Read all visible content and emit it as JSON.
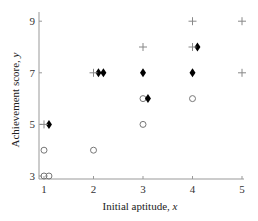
{
  "chart_data": {
    "type": "scatter",
    "title": "",
    "xlabel": "Initial aptitude, x",
    "xlabel_main": "Initial aptitude, ",
    "xlabel_var": "x",
    "ylabel": "Achievement score, y",
    "ylabel_main": "Achievement score, ",
    "ylabel_var": "y",
    "xlim": [
      1,
      5
    ],
    "ylim": [
      3,
      9
    ],
    "xticks": [
      1,
      2,
      3,
      4,
      5
    ],
    "yticks": [
      3,
      5,
      7,
      9
    ],
    "grid": false,
    "legend": null,
    "series": [
      {
        "name": "circles",
        "marker": "open-circle",
        "color": "#777777",
        "points": [
          [
            1,
            3
          ],
          [
            1.1,
            3
          ],
          [
            1,
            4
          ],
          [
            2,
            4
          ],
          [
            3,
            5
          ],
          [
            3,
            6
          ],
          [
            4,
            6
          ]
        ]
      },
      {
        "name": "diamonds",
        "marker": "filled-diamond",
        "color": "#000000",
        "points": [
          [
            1.1,
            5
          ],
          [
            2.1,
            7
          ],
          [
            2.2,
            7
          ],
          [
            3.1,
            6
          ],
          [
            3,
            7
          ],
          [
            4,
            7
          ],
          [
            4.1,
            8
          ]
        ]
      },
      {
        "name": "pluses",
        "marker": "plus",
        "color": "#888888",
        "points": [
          [
            1,
            5
          ],
          [
            2,
            7
          ],
          [
            3,
            8
          ],
          [
            4,
            8
          ],
          [
            4,
            9
          ],
          [
            5,
            9
          ],
          [
            5,
            7
          ]
        ]
      }
    ]
  }
}
